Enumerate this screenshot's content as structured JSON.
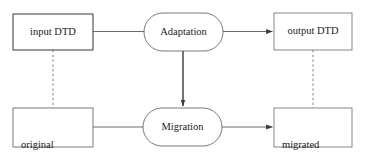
{
  "diagram": {
    "background_color": "#ffffff",
    "stroke_color": "#4a4a4a",
    "text_color": "#1a1a1a",
    "nodes": [
      {
        "id": "input-dtd",
        "label": "input DTD",
        "shape": "rectangle",
        "x": 13,
        "y": 14,
        "w": 80,
        "h": 36
      },
      {
        "id": "adaptation",
        "label": "Adaptation",
        "shape": "stadium",
        "x": 144,
        "y": 13,
        "w": 79,
        "h": 38
      },
      {
        "id": "output-dtd",
        "label": "output DTD",
        "shape": "rectangle",
        "x": 274,
        "y": 13,
        "w": 78,
        "h": 37
      },
      {
        "id": "original-document",
        "label_line1": "original",
        "label_line2": "document",
        "shape": "rectangle",
        "x": 13,
        "y": 108,
        "w": 80,
        "h": 39
      },
      {
        "id": "migration",
        "label": "Migration",
        "shape": "stadium",
        "x": 143,
        "y": 108,
        "w": 79,
        "h": 38
      },
      {
        "id": "migrated-document",
        "label_line1": "migrated",
        "label_line2": "document",
        "shape": "rectangle",
        "x": 274,
        "y": 108,
        "w": 78,
        "h": 39
      }
    ],
    "edges": [
      {
        "id": "input-dtd-to-adaptation",
        "from": "input-dtd",
        "to": "adaptation",
        "style": "solid",
        "arrow": false
      },
      {
        "id": "adaptation-to-output-dtd",
        "from": "adaptation",
        "to": "output-dtd",
        "style": "solid",
        "arrow": true
      },
      {
        "id": "adaptation-to-migration",
        "from": "adaptation",
        "to": "migration",
        "style": "solid",
        "arrow": true
      },
      {
        "id": "original-document-to-migration",
        "from": "original-document",
        "to": "migration",
        "style": "solid",
        "arrow": false
      },
      {
        "id": "migration-to-migrated-document",
        "from": "migration",
        "to": "migrated-document",
        "style": "solid",
        "arrow": true
      },
      {
        "id": "input-dtd-to-original-document",
        "from": "input-dtd",
        "to": "original-document",
        "style": "dotted",
        "arrow": false
      },
      {
        "id": "output-dtd-to-migrated-document",
        "from": "output-dtd",
        "to": "migrated-document",
        "style": "dotted",
        "arrow": false
      }
    ]
  }
}
